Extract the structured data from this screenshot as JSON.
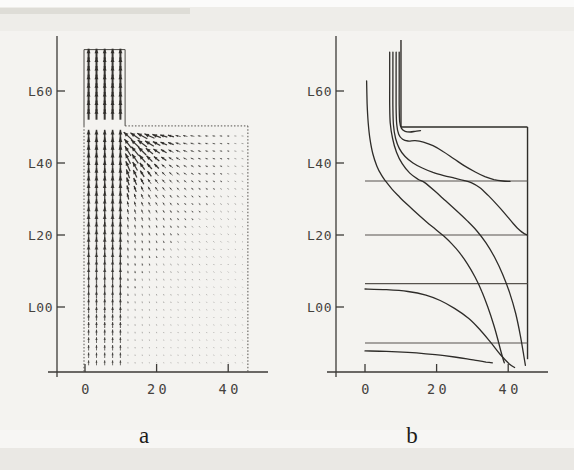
{
  "figure": {
    "type": "two-panel flow figure (scanned)",
    "background_color": "#f4f3f0",
    "ink_color": "#2e2c29",
    "line_color": "#57534e",
    "panel_a": {
      "caption": "a",
      "content": "velocity vector field"
    },
    "panel_b": {
      "caption": "b",
      "content": "streamlines"
    }
  },
  "chart_data": [
    {
      "panel": "a",
      "type": "quiver",
      "description": "Vector field of flow drawn upward from a wide cavity into a narrow vertical channel; arrows largest in and under the channel, tiny in the far field",
      "x_ticks": [
        {
          "label": "0",
          "value": 0
        },
        {
          "label": "20",
          "value": 20
        },
        {
          "label": "40",
          "value": 40
        }
      ],
      "y_ticks": [
        {
          "label": "L60",
          "value": 1.6
        },
        {
          "label": "L40",
          "value": 1.4
        },
        {
          "label": "L20",
          "value": 1.2
        },
        {
          "label": "L00",
          "value": 1.0
        }
      ],
      "x_range": [
        0,
        45.5
      ],
      "y_range": [
        0.82,
        1.74
      ],
      "grid_on": false,
      "geometry": {
        "step_y": 1.503,
        "channel_left_x": 0,
        "channel_right_x": 11.2,
        "channel_top_y": 1.715,
        "right_wall_x": 45.5
      },
      "channel_arrow_columns_x": [
        1.0,
        3.2,
        5.5,
        7.7,
        9.9
      ],
      "channel_rows": {
        "y_start": 1.535,
        "y_step": 0.024,
        "y_end": 1.705
      },
      "field_grid": {
        "x_start": 12,
        "x_step": 2,
        "x_end": 45,
        "y_start": 0.845,
        "y_step": 0.021,
        "y_end": 1.475
      },
      "sink_data_xy": [
        5,
        1.515
      ]
    },
    {
      "panel": "b",
      "type": "line",
      "description": "Streamlines of the same flow: horizontal far-field lines, curved streamlines converging into the channel, vertical bundle inside the channel",
      "x_ticks": [
        {
          "label": "0",
          "value": 0
        },
        {
          "label": "20",
          "value": 20
        },
        {
          "label": "40",
          "value": 40
        }
      ],
      "y_ticks": [
        {
          "label": "L60",
          "value": 1.6
        },
        {
          "label": "L40",
          "value": 1.4
        },
        {
          "label": "L20",
          "value": 1.2
        },
        {
          "label": "L00",
          "value": 1.0
        }
      ],
      "x_range": [
        0,
        45.5
      ],
      "y_range": [
        0.82,
        1.74
      ],
      "grid_on": false,
      "geometry": {
        "step_y": 1.5,
        "channel_right_x": 10.05,
        "right_wall_x": 45.4,
        "wall_bottom_y": 0.855,
        "channel_top_y": 1.74
      },
      "horizontal_streamlines_y": [
        1.35,
        1.2,
        1.065,
        0.9
      ],
      "streamlines": {
        "s1": [
          [
            0.45,
            1.628
          ],
          [
            0.6,
            1.565
          ],
          [
            0.9,
            1.512
          ],
          [
            1.4,
            1.466
          ],
          [
            2.2,
            1.425
          ],
          [
            3.3,
            1.392
          ],
          [
            4.6,
            1.366
          ],
          [
            5.8,
            1.349
          ],
          [
            7.6,
            1.327
          ],
          [
            9.7,
            1.305
          ],
          [
            12.2,
            1.281
          ],
          [
            14.7,
            1.258
          ],
          [
            17.2,
            1.236
          ],
          [
            19.7,
            1.216
          ],
          [
            22.0,
            1.197
          ],
          [
            24.2,
            1.176
          ],
          [
            26.4,
            1.151
          ],
          [
            28.6,
            1.12
          ],
          [
            30.7,
            1.084
          ],
          [
            32.6,
            1.044
          ],
          [
            34.3,
            1.0
          ],
          [
            35.9,
            0.952
          ],
          [
            37.2,
            0.906
          ],
          [
            38.2,
            0.868
          ],
          [
            38.9,
            0.845
          ]
        ],
        "v1": [
          [
            6.9,
            1.708
          ],
          [
            6.9,
            1.62
          ],
          [
            6.9,
            1.56
          ],
          [
            7.05,
            1.512
          ],
          [
            7.7,
            1.468
          ],
          [
            8.8,
            1.43
          ],
          [
            10.4,
            1.398
          ],
          [
            12.5,
            1.372
          ],
          [
            14.8,
            1.355
          ],
          [
            16.6,
            1.346
          ],
          [
            19.5,
            1.322
          ],
          [
            22.5,
            1.295
          ],
          [
            25.5,
            1.268
          ],
          [
            28.5,
            1.24
          ],
          [
            31.2,
            1.212
          ],
          [
            33.8,
            1.178
          ],
          [
            36.2,
            1.138
          ],
          [
            38.4,
            1.092
          ],
          [
            40.4,
            1.04
          ],
          [
            42.1,
            0.982
          ],
          [
            43.4,
            0.92
          ],
          [
            44.3,
            0.868
          ],
          [
            44.8,
            0.838
          ]
        ],
        "v2": [
          [
            7.8,
            1.708
          ],
          [
            7.8,
            1.62
          ],
          [
            7.8,
            1.555
          ],
          [
            7.95,
            1.505
          ],
          [
            8.55,
            1.468
          ],
          [
            9.6,
            1.44
          ],
          [
            11.2,
            1.418
          ],
          [
            13.4,
            1.4
          ],
          [
            16.0,
            1.386
          ],
          [
            19.0,
            1.374
          ],
          [
            22.0,
            1.365
          ],
          [
            25.0,
            1.358
          ],
          [
            27.5,
            1.352
          ],
          [
            29.8,
            1.345
          ],
          [
            32.0,
            1.332
          ],
          [
            34.4,
            1.31
          ],
          [
            36.8,
            1.285
          ],
          [
            39.2,
            1.258
          ],
          [
            41.4,
            1.232
          ],
          [
            43.2,
            1.213
          ],
          [
            44.6,
            1.203
          ],
          [
            45.4,
            1.2
          ]
        ],
        "v3": [
          [
            8.7,
            1.708
          ],
          [
            8.7,
            1.62
          ],
          [
            8.7,
            1.555
          ],
          [
            8.85,
            1.508
          ],
          [
            9.4,
            1.48
          ],
          [
            10.5,
            1.466
          ],
          [
            12.0,
            1.461
          ],
          [
            14.0,
            1.462
          ],
          [
            16.3,
            1.458
          ],
          [
            19.0,
            1.448
          ],
          [
            21.8,
            1.432
          ],
          [
            24.8,
            1.412
          ],
          [
            27.8,
            1.392
          ],
          [
            30.8,
            1.375
          ],
          [
            33.5,
            1.362
          ],
          [
            36.0,
            1.354
          ],
          [
            38.5,
            1.35
          ],
          [
            40.5,
            1.349
          ]
        ],
        "v4": [
          [
            9.55,
            1.708
          ],
          [
            9.55,
            1.62
          ],
          [
            9.55,
            1.558
          ],
          [
            9.7,
            1.515
          ],
          [
            10.2,
            1.496
          ],
          [
            11.2,
            1.488
          ],
          [
            12.6,
            1.486
          ],
          [
            14.0,
            1.488
          ],
          [
            15.5,
            1.49
          ]
        ],
        "c5": [
          [
            0,
            1.05
          ],
          [
            6,
            1.048
          ],
          [
            12,
            1.043
          ],
          [
            17,
            1.033
          ],
          [
            21,
            1.018
          ],
          [
            25,
            0.996
          ],
          [
            29,
            0.968
          ],
          [
            32,
            0.938
          ],
          [
            35,
            0.903
          ],
          [
            37.8,
            0.868
          ],
          [
            40.3,
            0.842
          ],
          [
            41.8,
            0.832
          ]
        ],
        "c6": [
          [
            0,
            0.878
          ],
          [
            6,
            0.877
          ],
          [
            12,
            0.874
          ],
          [
            17,
            0.87
          ],
          [
            21,
            0.866
          ],
          [
            25,
            0.861
          ],
          [
            28.5,
            0.856
          ],
          [
            31.5,
            0.851
          ],
          [
            33.8,
            0.847
          ],
          [
            35.6,
            0.845
          ]
        ]
      }
    }
  ]
}
